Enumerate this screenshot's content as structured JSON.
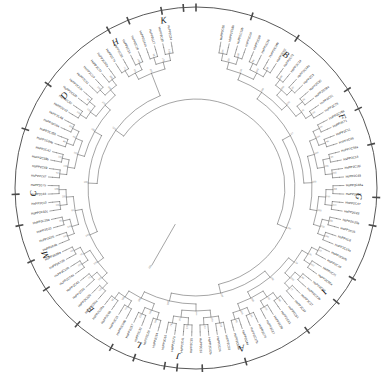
{
  "figure": {
    "title": "",
    "type": "circular-phylogenetic-tree",
    "gene_family": "PP2C",
    "species_prefix": "HsPP2C",
    "layout": {
      "shape": "circle",
      "center_x": 196,
      "center_y": 188,
      "outer_radius": 181,
      "leaf_label_radius": 150,
      "tree_inner_radius": 52,
      "rotation_start_deg": -90,
      "n_leaves": 104
    }
  },
  "groups": [
    {
      "id": "A",
      "label": "A",
      "angle_deg": 74,
      "radius": 166
    },
    {
      "id": "B",
      "label": "B",
      "angle_deg": -56,
      "radius": 160
    },
    {
      "id": "C",
      "label": "C",
      "angle_deg": 178,
      "radius": 162
    },
    {
      "id": "D",
      "label": "D",
      "angle_deg": -145,
      "radius": 160
    },
    {
      "id": "E",
      "label": "E",
      "angle_deg": 131,
      "radius": 160
    },
    {
      "id": "F",
      "label": "F",
      "angle_deg": -26,
      "radius": 162
    },
    {
      "id": "G",
      "label": "G",
      "angle_deg": 3,
      "radius": 162
    },
    {
      "id": "H",
      "label": "H",
      "angle_deg": -119,
      "radius": 166
    },
    {
      "id": "I",
      "label": "I",
      "angle_deg": 39,
      "radius": 164
    },
    {
      "id": "J",
      "label": "J",
      "angle_deg": 96,
      "radius": 168
    },
    {
      "id": "K",
      "label": "K",
      "angle_deg": -101,
      "radius": 170
    },
    {
      "id": "L",
      "label": "L",
      "angle_deg": 110,
      "radius": 166
    },
    {
      "id": "M",
      "label": "M",
      "angle_deg": 156,
      "radius": 164
    }
  ],
  "group_dividers_deg": [
    -112,
    -94,
    -72,
    -33,
    -14,
    12,
    30,
    52,
    88,
    100,
    118,
    146,
    168,
    -161
  ],
  "leaves": [
    "HsPP2C50",
    "HsPP2C18b",
    "HsPP2C13b",
    "HsPP2C04",
    "HsPP2C09",
    "HsPP2C36",
    "HsPP2C34b",
    "HsPP2C52",
    "HsPP2C72",
    "HsPP2C14",
    "HsPP2C14a",
    "HsPP2C3",
    "HsPP2C30",
    "HsPP2C08a",
    "HsPP2C01",
    "HsPP2C76",
    "HsPP2C78a",
    "HsPP2C71",
    "HsPP2C11",
    "HsPP2C46",
    "HsPP2C58a",
    "HsPP2C13",
    "HsPP2C16i",
    "HsPP2C49",
    "HsPP2C48a",
    "HsPP2C07",
    "HsPP2C47",
    "HsPP2C22",
    "HsPP2C20a",
    "HsPP2C25",
    "HsPP2C6",
    "HsPP2C19a",
    "HsPP2C07b",
    "HsPP2C40",
    "HsPP2C21",
    "HsPP2C66a",
    "HsPP2C12",
    "HsPP2C23b",
    "HsPP2C37",
    "HsPP2C39",
    "HsPP2C54",
    "HsPP2C61",
    "HsPP2C26",
    "HsPP2C27",
    "HsPP2C70",
    "HsPP2C17b",
    "HsPP2C44",
    "HsPP2C68b",
    "HsPP2C53",
    "HsPP2C24",
    "HsPP2C02b",
    "HsPP2C31",
    "HsPP2C35",
    "HsPP2C41",
    "HsPP2C73",
    "HsPP2C65",
    "HsPP2C64",
    "HsPP2C28",
    "HsPP2C32",
    "HsPP2C57",
    "HsPP2C09b",
    "HsPP2C15",
    "HsPP2C60",
    "HsPP2C38a",
    "HsPP2C56a",
    "HsPP2C32b",
    "HsPP2C55",
    "HsPP2C45",
    "HsPP2C04a",
    "HsPP2C10b",
    "HsPP2C73b",
    "HsPP2C68a",
    "HsPP2C4b",
    "HsPP2C05",
    "HsPP2C23",
    "HsPP2C29a",
    "HsPP2C32c",
    "HsPP2C10",
    "HsPP2C63",
    "HsPP2C75",
    "HsPP2C67",
    "HsPP2C69",
    "HsPP2C58b",
    "HsPP2C42",
    "HsPP2C30b",
    "HsPP2C35b",
    "HsPP2C59a",
    "HsPP2C48",
    "HsPP2C43",
    "HsPP2C62",
    "HsPP2C12b",
    "HsPP2C13c",
    "HsPP2C51",
    "HsPP2C19",
    "HsPP2C77",
    "HsPP2C02a",
    "HsPP2C74",
    "HsPP2C33",
    "HsPP2C16",
    "HsPP2C18",
    "HsPP2C44a",
    "HsPP2C17",
    "HsPP2C20",
    "HsPP2C34"
  ],
  "bootstrap_values": [
    100,
    100,
    99,
    98,
    100,
    97,
    96,
    100,
    99,
    95,
    93,
    100,
    98,
    100,
    86,
    100,
    92,
    100,
    99,
    77,
    100,
    100,
    88,
    96,
    100,
    90,
    100,
    79,
    100,
    100,
    74,
    91,
    100,
    72,
    100,
    98,
    100,
    85,
    100,
    100,
    64,
    100,
    89,
    100,
    100,
    81,
    100,
    100,
    73,
    100,
    58,
    100,
    99,
    100,
    100,
    61,
    100,
    100,
    100,
    100,
    55,
    100,
    95,
    100,
    100,
    87,
    100,
    100,
    100,
    76,
    100,
    100,
    100,
    94,
    100,
    100,
    69,
    100,
    100,
    100,
    100,
    100,
    53,
    100,
    100,
    100,
    100,
    84,
    100,
    100,
    100,
    100,
    100,
    100,
    100,
    100,
    100,
    67,
    100,
    100,
    100,
    100,
    100,
    71
  ],
  "ticks_deg": [
    -90,
    -112,
    -72,
    -33,
    -14,
    12,
    30,
    52,
    88,
    100,
    118,
    146,
    168,
    -161,
    -94,
    -56,
    -145,
    -119,
    -101,
    74,
    39,
    3,
    -26,
    131,
    156,
    178,
    110,
    96
  ],
  "colors": {
    "ring": "#3a3a3a",
    "branch": "#4a4a4a",
    "leaf_text": "#242424",
    "bootstrap_text": "#7d7d7d",
    "group_text": "#151515",
    "background": "#ffffff"
  }
}
